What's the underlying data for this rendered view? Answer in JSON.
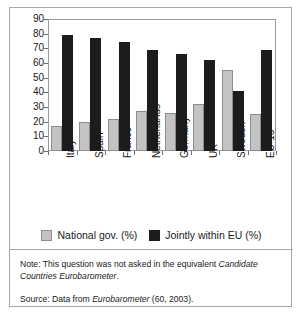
{
  "chart_data": {
    "type": "bar",
    "title": "",
    "subtitle": "",
    "xlabel": "",
    "ylabel": "",
    "ylim": [
      0,
      90
    ],
    "ytick_step": 10,
    "yticks": [
      90,
      80,
      70,
      60,
      50,
      40,
      30,
      20,
      10,
      0
    ],
    "grid": false,
    "legend_position": "bottom-center",
    "categories": [
      "Italy",
      "Spain",
      "France",
      "Netherlands",
      "Germany",
      "UK",
      "Sweden",
      "EU-15"
    ],
    "series": [
      {
        "name": "National gov. (%)",
        "color": "#c3c3c3",
        "values": [
          17,
          20,
          22,
          27,
          26,
          32,
          55,
          25
        ]
      },
      {
        "name": "Jointly within EU (%)",
        "color": "#1c1c1c",
        "values": [
          79,
          77,
          74,
          69,
          66,
          62,
          41,
          69
        ]
      }
    ]
  },
  "legend": {
    "entries": [
      {
        "label": "National gov. (%)",
        "swatch": "national"
      },
      {
        "label": "Jointly within EU (%)",
        "swatch": "joint"
      }
    ]
  },
  "footnotes": {
    "note_prefix": "Note: This question was not asked in the equivalent ",
    "note_italic_1": "Candidate",
    "note_italic_2": "Countries Eurobarometer",
    "note_suffix": ".",
    "source_prefix": "Source:  Data from ",
    "source_italic": "Eurobarometer",
    "source_suffix": " (60, 2003)."
  },
  "colors": {
    "national_bar": "#c3c3c3",
    "national_bar_border": "#8c8c8c",
    "joint_bar": "#1c1c1c",
    "frame_border": "#a8a8a8",
    "axis": "#6e6e6e",
    "text": "#1a1a1a",
    "background": "#ffffff"
  }
}
